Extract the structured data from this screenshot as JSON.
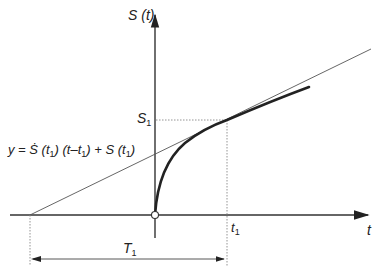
{
  "diagram": {
    "y_axis_label": "S (t)",
    "x_axis_label": "t",
    "s1_label": "S",
    "s1_sub": "1",
    "t1_label": "t",
    "t1_sub": "1",
    "T1_label": "T",
    "T1_sub": "1",
    "tangent_equation": {
      "prefix": "y = ",
      "sdot": "Ṡ",
      "part1": " (t",
      "sub1": "1",
      "part2": ") (t–t",
      "sub2": "1",
      "part3": ") + S (t",
      "sub3": "1",
      "part4": ")"
    },
    "colors": {
      "curve": "#222222",
      "axis": "#333333",
      "tangent": "#555555",
      "guide": "#888888"
    }
  }
}
